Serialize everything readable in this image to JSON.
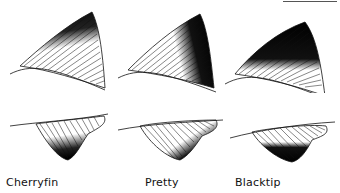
{
  "figure": {
    "type": "fin-comparison-illustration",
    "rows": [
      "dorsal-fin",
      "anal-fin"
    ],
    "columns": [
      {
        "id": "cherryfin",
        "label": "Cherryfin",
        "dorsal_dark_region": "upper-tip",
        "anal_dark_region": "lower-tip"
      },
      {
        "id": "pretty",
        "label": "Pretty",
        "dorsal_dark_region": "outer-margin-band",
        "anal_dark_region": "outer-margin-band"
      },
      {
        "id": "blacktip",
        "label": "Blacktip",
        "dorsal_dark_region": "upper-half",
        "anal_dark_region": "lower-half"
      }
    ],
    "scale_bar": true
  },
  "labels": {
    "cherryfin": "Cherryfin",
    "pretty": "Pretty",
    "blacktip": "Blacktip"
  },
  "colors": {
    "ink": "#111111",
    "ray": "#222222",
    "background": "#ffffff"
  }
}
